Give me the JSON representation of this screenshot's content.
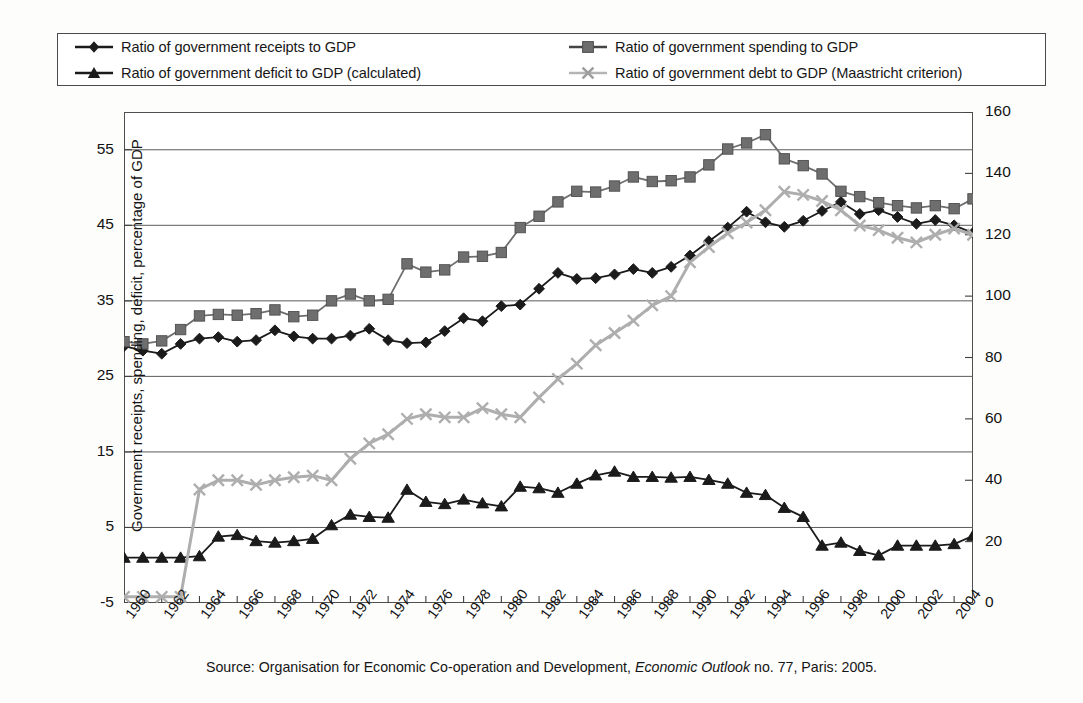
{
  "legend": {
    "items": [
      {
        "label": "Ratio of government receipts to GDP",
        "marker": "diamond-marker",
        "color": "#1b1b1b"
      },
      {
        "label": "Ratio of government spending to GDP",
        "marker": "square-marker",
        "color": "#6e6e6e"
      },
      {
        "label": "Ratio of government deficit to GDP (calculated)",
        "marker": "triangle-marker",
        "color": "#1b1b1b"
      },
      {
        "label": "Ratio of government debt to GDP (Maastricht criterion)",
        "marker": "cross-marker",
        "color": "#aeaeae"
      }
    ]
  },
  "source": {
    "prefix": "Source: Organisation for Economic Co-operation and Development, ",
    "italic": "Economic Outlook",
    "suffix": " no. 77, Paris: 2005."
  },
  "chart_data": {
    "type": "line",
    "title": "",
    "xlabel": "",
    "ylabel": "Government receipts, spending, deficit, percentage of GDP",
    "y2label": "Government debt, percentage of GDP",
    "grid": true,
    "legend_position": "top",
    "xlim": [
      1960,
      2005
    ],
    "ylim": [
      -5,
      60
    ],
    "y2lim": [
      0,
      160
    ],
    "yticks": [
      -5,
      5,
      15,
      25,
      35,
      45,
      55
    ],
    "y2ticks": [
      0,
      20,
      40,
      60,
      80,
      100,
      120,
      140,
      160
    ],
    "xticks": [
      1960,
      1962,
      1964,
      1966,
      1968,
      1970,
      1972,
      1974,
      1976,
      1978,
      1980,
      1982,
      1984,
      1986,
      1988,
      1990,
      1992,
      1994,
      1996,
      1998,
      2000,
      2002,
      2004
    ],
    "x": [
      1960,
      1961,
      1962,
      1963,
      1964,
      1965,
      1966,
      1967,
      1968,
      1969,
      1970,
      1971,
      1972,
      1973,
      1974,
      1975,
      1976,
      1977,
      1978,
      1979,
      1980,
      1981,
      1982,
      1983,
      1984,
      1985,
      1986,
      1987,
      1988,
      1989,
      1990,
      1991,
      1992,
      1993,
      1994,
      1995,
      1996,
      1997,
      1998,
      1999,
      2000,
      2001,
      2002,
      2003,
      2004,
      2005
    ],
    "series": [
      {
        "name": "Ratio of government receipts to GDP",
        "axis": "left",
        "marker": "diamond",
        "color": "#1b1b1b",
        "values": [
          29.0,
          28.4,
          28.0,
          29.3,
          30.0,
          30.2,
          29.6,
          29.8,
          31.1,
          30.3,
          30.0,
          30.0,
          30.4,
          31.3,
          29.8,
          29.4,
          29.5,
          31.0,
          32.7,
          32.3,
          34.3,
          34.5,
          36.6,
          38.7,
          37.9,
          38.0,
          38.5,
          39.2,
          38.7,
          39.5,
          41.0,
          42.9,
          44.7,
          46.8,
          45.4,
          44.8,
          45.6,
          46.9,
          48.1,
          46.5,
          47.0,
          46.1,
          45.2,
          45.7,
          45.0,
          44.0
        ]
      },
      {
        "name": "Ratio of government spending to GDP",
        "axis": "left",
        "marker": "square",
        "color": "#6e6e6e",
        "values": [
          29.6,
          29.3,
          29.7,
          31.2,
          33.0,
          33.2,
          33.1,
          33.3,
          33.8,
          32.9,
          33.1,
          35.0,
          35.9,
          35.0,
          35.2,
          39.9,
          38.8,
          39.1,
          40.8,
          40.9,
          41.4,
          44.7,
          46.2,
          48.1,
          49.5,
          49.4,
          50.2,
          51.4,
          50.8,
          50.9,
          51.4,
          53.0,
          55.1,
          55.9,
          57.0,
          53.8,
          52.9,
          51.8,
          49.5,
          48.8,
          48.0,
          47.6,
          47.3,
          47.6,
          47.2,
          48.5
        ]
      },
      {
        "name": "Ratio of government deficit to GDP (calculated)",
        "axis": "left",
        "marker": "triangle",
        "color": "#1b1b1b",
        "values": [
          1.0,
          1.0,
          1.0,
          1.0,
          1.2,
          3.8,
          4.0,
          3.2,
          3.0,
          3.2,
          3.5,
          5.3,
          6.7,
          6.4,
          6.3,
          10.0,
          8.4,
          8.1,
          8.7,
          8.2,
          7.8,
          10.4,
          10.2,
          9.6,
          10.8,
          11.9,
          12.4,
          11.7,
          11.7,
          11.6,
          11.7,
          11.3,
          10.8,
          9.6,
          9.3,
          7.6,
          6.4,
          2.6,
          3.0,
          1.9,
          1.3,
          2.6,
          2.6,
          2.6,
          2.8,
          3.9
        ]
      },
      {
        "name": "Ratio of government debt to GDP (Maastricht criterion)",
        "axis": "right",
        "marker": "cross",
        "color": "#aeaeae",
        "values": [
          2.0,
          2.0,
          2.0,
          2.0,
          37.0,
          40.0,
          40.0,
          38.5,
          40.0,
          41.0,
          41.5,
          40.0,
          47.0,
          52.0,
          55.0,
          60.0,
          61.5,
          60.5,
          60.5,
          63.5,
          61.5,
          60.5,
          67.0,
          73.0,
          78.0,
          84.0,
          88.0,
          92.0,
          97.0,
          100.0,
          111.0,
          116.0,
          120.5,
          124.0,
          128.0,
          134.0,
          133.0,
          131.0,
          128.0,
          123.0,
          121.5,
          119.0,
          117.5,
          120.0,
          122.0,
          120.0
        ]
      }
    ]
  }
}
